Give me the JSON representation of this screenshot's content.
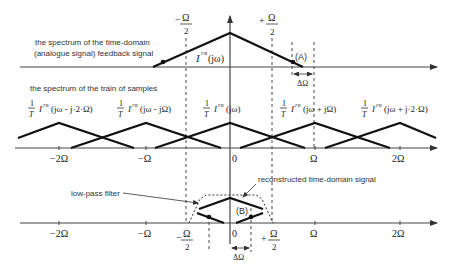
{
  "top_panel": {
    "caption_line1": "the spectrum of the time-domain",
    "caption_line2": "(analogue signal) feedback signal",
    "signal_label_main": "I",
    "signal_label_sup": "FB",
    "signal_label_arg": "(jω)",
    "minus_half_omega_sign": "−",
    "plus_half_omega_sign": "+",
    "omega": "Ω",
    "two": "2",
    "marker_A": "(A)",
    "delta_omega": "ΔΩ"
  },
  "middle_panel": {
    "caption": "the spectrum of the train of samples",
    "replica_labels": [
      {
        "num": "1",
        "den": "T",
        "main": "I",
        "sup": "FB",
        "arg": "(jω - j·2·Ω)"
      },
      {
        "num": "1",
        "den": "T",
        "main": "I",
        "sup": "FB",
        "arg": "(jω - jΩ)"
      },
      {
        "num": "1",
        "den": "T",
        "main": "I",
        "sup": "FB",
        "arg": "(jω)"
      },
      {
        "num": "1",
        "den": "T",
        "main": "I",
        "sup": "FB",
        "arg": "(jω + jΩ)"
      },
      {
        "num": "1",
        "den": "T",
        "main": "I",
        "sup": "FB",
        "arg": "(jω + j·2·Ω)"
      }
    ],
    "ticks": [
      "−2Ω",
      "−Ω",
      "0",
      "Ω",
      "2Ω"
    ]
  },
  "bottom_panel": {
    "filter_label": "low-pass filter",
    "reconstructed_label": "reconstructed time-domain signal",
    "marker_B": "(B)",
    "ticks": [
      "−2Ω",
      "−Ω",
      "0",
      "Ω",
      "2Ω"
    ],
    "minus_half_omega_sign": "−",
    "plus_half_omega_sign": "+",
    "omega": "Ω",
    "two": "2",
    "delta_omega": "ΔΩ"
  }
}
